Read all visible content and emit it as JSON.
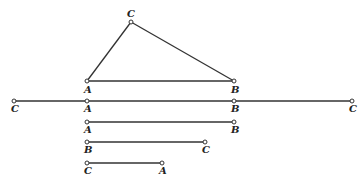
{
  "triangle": {
    "vertices": [
      {
        "label": "C",
        "x": 131,
        "y": 22,
        "lx": 127,
        "ly": 17
      },
      {
        "label": "A",
        "x": 87,
        "y": 81,
        "lx": 84,
        "ly": 93
      },
      {
        "label": "B",
        "x": 234,
        "y": 81,
        "lx": 231,
        "ly": 93
      }
    ]
  },
  "segments": [
    {
      "name": "line-c-a-b-c",
      "y": 101,
      "points": [
        {
          "label": "C",
          "x": 14
        },
        {
          "label": "A",
          "x": 87
        },
        {
          "label": "B",
          "x": 234
        },
        {
          "label": "C",
          "x": 352
        }
      ]
    },
    {
      "name": "line-a-b",
      "y": 122,
      "points": [
        {
          "label": "A",
          "x": 87
        },
        {
          "label": "B",
          "x": 234
        }
      ]
    },
    {
      "name": "line-b-c",
      "y": 142,
      "points": [
        {
          "label": "B",
          "x": 87
        },
        {
          "label": "C",
          "x": 205
        }
      ]
    },
    {
      "name": "line-c-a",
      "y": 163,
      "points": [
        {
          "label": "C",
          "x": 87
        },
        {
          "label": "A",
          "x": 162
        }
      ]
    }
  ]
}
